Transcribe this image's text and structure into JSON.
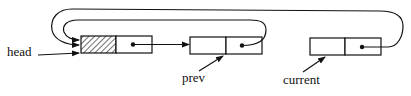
{
  "diagram": {
    "type": "linked-list",
    "labels": {
      "head": "head",
      "prev": "prev",
      "current": "current"
    },
    "nodes": [
      {
        "id": "head-node",
        "data_hatched": true,
        "has_pointer": true
      },
      {
        "id": "prev-node",
        "data_hatched": false,
        "has_pointer": true
      },
      {
        "id": "current-node",
        "data_hatched": false,
        "has_pointer": true
      }
    ],
    "edges": [
      {
        "from": "head-node.next",
        "to": "prev-node"
      },
      {
        "from": "prev-node.next",
        "to": "head-node"
      },
      {
        "from": "current-node.next",
        "to": "head-node"
      },
      {
        "from": "head-label",
        "to": "head-node"
      },
      {
        "from": "prev-label",
        "to": "prev-node"
      },
      {
        "from": "current-label",
        "to": "current-node"
      }
    ],
    "colors": {
      "stroke": "#111111",
      "background": "#ffffff"
    }
  }
}
